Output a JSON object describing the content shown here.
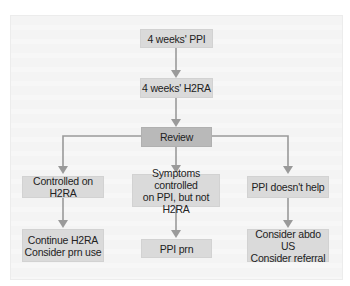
{
  "diagram": {
    "colors": {
      "panel_bg": "#f5f5f5",
      "box_bg": "#dadada",
      "review_bg": "#b9b9b9",
      "connector": "#9a9a9a",
      "text": "#222222"
    },
    "nodes": {
      "step1": {
        "lines": [
          "4 weeks' PPI"
        ]
      },
      "step2": {
        "lines": [
          "4 weeks' H2RA"
        ]
      },
      "review": {
        "lines": [
          "Review"
        ]
      },
      "branch_left": {
        "lines": [
          "Controlled on H2RA"
        ]
      },
      "branch_middle": {
        "lines": [
          "Symptoms controlled",
          "on PPI, but not H2RA"
        ]
      },
      "branch_right": {
        "lines": [
          "PPI doesn't help"
        ]
      },
      "outcome_left": {
        "lines": [
          "Continue H2RA",
          "Consider prn use"
        ]
      },
      "outcome_middle": {
        "lines": [
          "PPI prn"
        ]
      },
      "outcome_right": {
        "lines": [
          "Consider abdo US",
          "Consider referral"
        ]
      }
    },
    "edges": [
      [
        "step1",
        "step2"
      ],
      [
        "step2",
        "review"
      ],
      [
        "review",
        "branch_left"
      ],
      [
        "review",
        "branch_middle"
      ],
      [
        "review",
        "branch_right"
      ],
      [
        "branch_left",
        "outcome_left"
      ],
      [
        "branch_middle",
        "outcome_middle"
      ],
      [
        "branch_right",
        "outcome_right"
      ]
    ]
  }
}
